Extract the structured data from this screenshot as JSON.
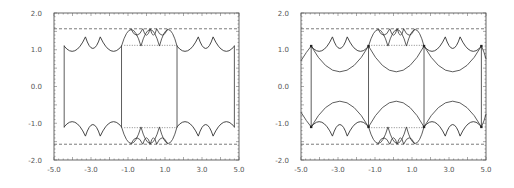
{
  "chart_data": [
    {
      "type": "line",
      "title": "",
      "xlabel": "",
      "ylabel": "",
      "xlim": [
        -5.0,
        5.0
      ],
      "ylim": [
        -2.0,
        2.0
      ],
      "x_ticks": [
        "-5.0",
        "-3.0",
        "-1.0",
        "1.0",
        "3.0",
        "5.0"
      ],
      "y_ticks": [
        "2.0",
        "1.0",
        "0.0",
        "-1.0",
        "-2.0"
      ],
      "grid": false,
      "dashed_lines_y": [
        1.571,
        -1.571
      ],
      "dotted_segments": [
        {
          "x": [
            -1.2,
            1.6
          ],
          "y": 1.12
        },
        {
          "x": [
            -1.2,
            1.6
          ],
          "y": -1.12
        }
      ],
      "vertical_lines_x": [
        -4.45,
        -1.35,
        1.65,
        4.75
      ],
      "description": "Fundamental-domain boundary made of circular arcs (scalloped top/bottom near y=±1.1, inner arcs reaching y=±1.57) joined by vertical segments"
    },
    {
      "type": "line",
      "title": "",
      "xlabel": "",
      "ylabel": "",
      "xlim": [
        -5.0,
        5.0
      ],
      "ylim": [
        -2.0,
        2.0
      ],
      "x_ticks": [
        "-5.0",
        "-3.0",
        "-1.0",
        "1.0",
        "3.0",
        "5.0"
      ],
      "y_ticks": [
        "2.0",
        "1.0",
        "0.0",
        "-1.0",
        "-2.0"
      ],
      "grid": false,
      "dashed_lines_y": [
        1.571,
        -1.571
      ],
      "dotted_segments": [
        {
          "x": [
            -1.2,
            1.6
          ],
          "y": 1.12
        },
        {
          "x": [
            -1.2,
            1.6
          ],
          "y": -1.12
        }
      ],
      "vertical_lines_x": [
        -4.45,
        -1.35,
        1.65,
        4.75
      ],
      "large_arcs_min_abs_y": 0.4,
      "description": "Tessellation of circular arcs: large arcs dipping to y=±0.4 between vertical lines, smaller scallops near y=±1.1 and inner arcs up to y=±1.57, marked vertices"
    }
  ]
}
